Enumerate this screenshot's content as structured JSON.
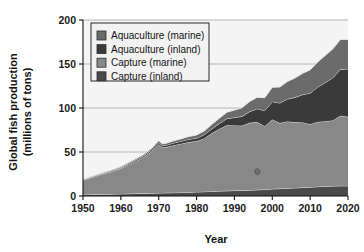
{
  "chart_data": {
    "type": "area",
    "stacked": true,
    "title": "",
    "xlabel": "Year",
    "ylabel": "Global fish production\n(millions of tons)",
    "ylabel_line1": "Global fish production",
    "ylabel_line2": "(millions of tons)",
    "xlim": [
      1950,
      2020
    ],
    "ylim": [
      0,
      200
    ],
    "xticks": [
      1950,
      1960,
      1970,
      1980,
      1990,
      2000,
      2010,
      2020
    ],
    "xtick_labels": [
      "1950",
      "1960",
      "1970",
      "1980",
      "1990",
      "2000",
      "2010",
      "2020"
    ],
    "yticks": [
      0,
      50,
      100,
      150,
      200
    ],
    "ytick_labels": [
      "0",
      "50",
      "100",
      "150",
      "200"
    ],
    "grid": "horizontal",
    "legend_position": "top-left-inside",
    "x": [
      1950,
      1952,
      1954,
      1956,
      1958,
      1960,
      1962,
      1964,
      1966,
      1968,
      1970,
      1971,
      1972,
      1974,
      1976,
      1978,
      1980,
      1982,
      1984,
      1986,
      1988,
      1990,
      1992,
      1994,
      1996,
      1998,
      2000,
      2002,
      2004,
      2006,
      2008,
      2010,
      2012,
      2014,
      2016,
      2018,
      2020
    ],
    "series": [
      {
        "name": "Capture (inland)",
        "color": "#4a4a4a",
        "values": [
          1.5,
          1.7,
          1.9,
          2.0,
          2.2,
          2.4,
          2.6,
          2.8,
          3.0,
          3.2,
          3.4,
          3.5,
          3.6,
          3.8,
          4.0,
          4.3,
          4.6,
          4.9,
          5.2,
          5.6,
          5.9,
          6.2,
          6.4,
          6.6,
          7.0,
          7.4,
          8.0,
          8.4,
          8.8,
          9.2,
          9.6,
          10.0,
          10.6,
          11.0,
          11.3,
          11.6,
          11.5
        ]
      },
      {
        "name": "Capture (marine)",
        "color": "#888888",
        "values": [
          16.5,
          19.0,
          21.5,
          24.0,
          26.0,
          29.0,
          33.0,
          37.0,
          41.0,
          47.0,
          55.5,
          51.5,
          52.0,
          54.0,
          55.5,
          57.0,
          57.5,
          60.5,
          66.0,
          70.5,
          74.5,
          74.0,
          73.5,
          76.5,
          77.0,
          72.0,
          79.0,
          74.5,
          76.0,
          74.5,
          74.0,
          71.5,
          73.5,
          74.0,
          74.5,
          79.5,
          78.5
        ]
      },
      {
        "name": "Aquaculture (inland)",
        "color": "#3a3a3a",
        "values": [
          0.5,
          0.6,
          0.7,
          0.8,
          0.9,
          1.0,
          1.2,
          1.4,
          1.6,
          1.8,
          2.0,
          2.1,
          2.2,
          2.5,
          2.8,
          3.2,
          3.6,
          4.2,
          5.0,
          6.2,
          7.6,
          9.0,
          10.6,
          12.8,
          15.2,
          17.6,
          20.2,
          22.8,
          25.4,
          28.4,
          31.6,
          35.4,
          39.6,
          44.0,
          48.6,
          52.8,
          54.4
        ]
      },
      {
        "name": "Aquaculture (marine)",
        "color": "#6b6b6b",
        "values": [
          0.5,
          0.6,
          0.7,
          0.8,
          0.9,
          1.0,
          1.1,
          1.3,
          1.5,
          1.7,
          2.0,
          2.1,
          2.2,
          2.5,
          2.8,
          3.2,
          3.6,
          4.2,
          5.0,
          6.0,
          7.2,
          8.4,
          9.8,
          11.4,
          13.0,
          14.6,
          16.4,
          18.2,
          20.0,
          22.0,
          24.2,
          26.4,
          28.6,
          30.8,
          32.8,
          34.0,
          33.6
        ]
      }
    ],
    "legend_entries": [
      {
        "label": "Aquaculture (marine)",
        "color": "#6b6b6b"
      },
      {
        "label": "Aquaculture (inland)",
        "color": "#3a3a3a"
      },
      {
        "label": "Capture (marine)",
        "color": "#888888"
      },
      {
        "label": "Capture (inland)",
        "color": "#4a4a4a"
      }
    ],
    "annotations": [
      {
        "name": "fish-marker",
        "x": 1996,
        "y": 29
      }
    ]
  }
}
